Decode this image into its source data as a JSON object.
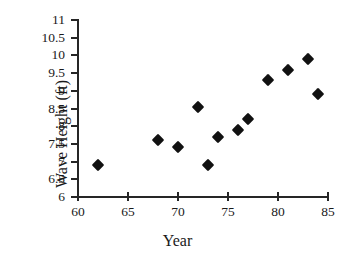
{
  "chart_data": {
    "type": "scatter",
    "title": "",
    "xlabel": "Year",
    "ylabel": "Wave Height (ft)",
    "xlim": [
      60,
      85
    ],
    "ylim": [
      6,
      11
    ],
    "grid": false,
    "legend": null,
    "marker_style": "filled-diamond",
    "marker_color": "#111111",
    "axis_color": "#262626",
    "xticks": [
      60,
      65,
      70,
      75,
      80,
      85
    ],
    "xtick_labels": [
      "60",
      "65",
      "70",
      "75",
      "80",
      "85"
    ],
    "yticks": [
      6,
      6.5,
      7,
      7.5,
      8,
      8.5,
      9,
      9.5,
      10,
      10.5,
      11
    ],
    "ytick_labels": [
      "6",
      "6.5",
      "7",
      "7.5",
      "8",
      "8.5",
      "9",
      "9.5",
      "10",
      "10.5",
      "11"
    ],
    "x": [
      62,
      68,
      70,
      72,
      73,
      74,
      76,
      77,
      79,
      81,
      83,
      84
    ],
    "y": [
      6.9,
      7.6,
      7.4,
      8.55,
      6.9,
      7.7,
      7.9,
      8.2,
      9.3,
      9.6,
      9.9,
      8.9
    ],
    "points": [
      {
        "x": 62,
        "y": 6.9
      },
      {
        "x": 68,
        "y": 7.6
      },
      {
        "x": 70,
        "y": 7.4
      },
      {
        "x": 72,
        "y": 8.55
      },
      {
        "x": 73,
        "y": 6.9
      },
      {
        "x": 74,
        "y": 7.7
      },
      {
        "x": 76,
        "y": 7.9
      },
      {
        "x": 77,
        "y": 8.2
      },
      {
        "x": 79,
        "y": 9.3
      },
      {
        "x": 81,
        "y": 9.6
      },
      {
        "x": 83,
        "y": 9.9
      },
      {
        "x": 84,
        "y": 8.9
      }
    ]
  }
}
